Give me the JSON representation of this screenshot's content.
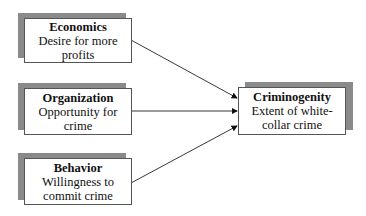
{
  "diagram": {
    "nodes": [
      {
        "id": "economics",
        "title": "Economics",
        "desc": "Desire for more profits"
      },
      {
        "id": "organization",
        "title": "Organization",
        "desc": "Opportunity for crime"
      },
      {
        "id": "behavior",
        "title": "Behavior",
        "desc": "Willingness to commit crime"
      },
      {
        "id": "criminogenity",
        "title": "Criminogenity",
        "desc": "Extent of white-collar crime"
      }
    ],
    "edges": [
      {
        "from": "economics",
        "to": "criminogenity"
      },
      {
        "from": "organization",
        "to": "criminogenity"
      },
      {
        "from": "behavior",
        "to": "criminogenity"
      }
    ]
  }
}
